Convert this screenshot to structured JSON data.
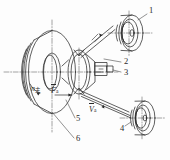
{
  "figure": {
    "kind": "engineering-line-drawing",
    "background_color": "#fdfdfd",
    "line_color": "#2b2b2b",
    "centerline_color": "#555555"
  },
  "callouts": [
    {
      "id": "1",
      "label": "1",
      "x": 149,
      "y": 11,
      "target": "upper-right cup roller"
    },
    {
      "id": "2",
      "label": "2",
      "x": 124,
      "y": 62,
      "target": "central cone rim"
    },
    {
      "id": "3",
      "label": "3",
      "x": 124,
      "y": 73,
      "target": "adjusting block"
    },
    {
      "id": "4",
      "label": "4",
      "x": 122,
      "y": 128,
      "target": "lower-right cup roller"
    },
    {
      "id": "5",
      "label": "5",
      "x": 76,
      "y": 121,
      "target": "driven cone shaft"
    },
    {
      "id": "6",
      "label": "6",
      "x": 76,
      "y": 140,
      "target": "large driving disc"
    }
  ],
  "vectors": [
    {
      "id": "n-disc",
      "symbol": "n",
      "subscript": "主",
      "x": 33,
      "y": 89,
      "overbar": false,
      "note": "disc rotation speed"
    },
    {
      "id": "F-axial",
      "symbol": "F",
      "subscript": "a",
      "x": 52,
      "y": 90,
      "overbar": true,
      "note": "axial force"
    },
    {
      "id": "V-belt",
      "symbol": "V",
      "subscript": "a",
      "x": 90,
      "y": 108,
      "overbar": true,
      "note": "belt velocity"
    }
  ]
}
